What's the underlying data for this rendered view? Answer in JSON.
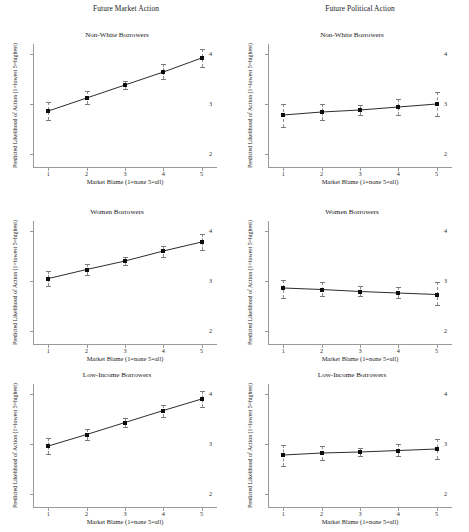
{
  "figure": {
    "columns": [
      {
        "title": "Future Market Action"
      },
      {
        "title": "Future Political Action"
      }
    ],
    "axis_titles": {
      "x": "Market Blame (1=none 5=all)",
      "y": "Predicted Likelihood of Action (1=lowest 5=highest)"
    },
    "xticks": [
      "1",
      "2",
      "3",
      "4",
      "5"
    ],
    "yticks": [
      "2",
      "3",
      "4"
    ]
  },
  "chart_data": [
    {
      "id": "market-nonwhite",
      "type": "line",
      "title": "Non-White Borrowers",
      "column": "Future Market Action",
      "xlabel": "Market Blame (1=none 5=all)",
      "ylabel": "Predicted Likelihood of Action (1=lowest 5=highest)",
      "x": [
        1,
        2,
        3,
        4,
        5
      ],
      "values": [
        2.86,
        3.12,
        3.38,
        3.64,
        3.92
      ],
      "ci_low": [
        2.68,
        3.0,
        3.3,
        3.5,
        3.75
      ],
      "ci_high": [
        3.04,
        3.26,
        3.47,
        3.8,
        4.1
      ],
      "xlim": [
        0.6,
        5.4
      ],
      "ylim": [
        1.72,
        4.2
      ],
      "grid": false,
      "legend": "none"
    },
    {
      "id": "political-nonwhite",
      "type": "line",
      "title": "Non-White Borrowers",
      "column": "Future Political Action",
      "xlabel": "Market Blame (1=none 5=all)",
      "ylabel": "Predicted Likelihood of Action (1=lowest 5=highest)",
      "x": [
        1,
        2,
        3,
        4,
        5
      ],
      "values": [
        2.78,
        2.84,
        2.88,
        2.94,
        3.0
      ],
      "ci_low": [
        2.55,
        2.68,
        2.79,
        2.78,
        2.76
      ],
      "ci_high": [
        3.0,
        3.0,
        2.99,
        3.1,
        3.25
      ],
      "xlim": [
        0.6,
        5.4
      ],
      "ylim": [
        1.72,
        4.2
      ],
      "grid": false,
      "legend": "none"
    },
    {
      "id": "market-women",
      "type": "line",
      "title": "Women Borrowers",
      "column": "Future Market Action",
      "xlabel": "Market Blame (1=none 5=all)",
      "ylabel": "Predicted Likelihood of Action (1=lowest 5=highest)",
      "x": [
        1,
        2,
        3,
        4,
        5
      ],
      "values": [
        3.05,
        3.23,
        3.4,
        3.6,
        3.78
      ],
      "ci_low": [
        2.9,
        3.12,
        3.32,
        3.48,
        3.62
      ],
      "ci_high": [
        3.2,
        3.34,
        3.48,
        3.71,
        3.94
      ],
      "xlim": [
        0.6,
        5.4
      ],
      "ylim": [
        1.72,
        4.2
      ],
      "grid": false,
      "legend": "none"
    },
    {
      "id": "political-women",
      "type": "line",
      "title": "Women Borrowers",
      "column": "Future Political Action",
      "xlabel": "Market Blame (1=none 5=all)",
      "ylabel": "Predicted Likelihood of Action (1=lowest 5=highest)",
      "x": [
        1,
        2,
        3,
        4,
        5
      ],
      "values": [
        2.86,
        2.83,
        2.79,
        2.76,
        2.73
      ],
      "ci_low": [
        2.66,
        2.71,
        2.71,
        2.66,
        2.52
      ],
      "ci_high": [
        3.03,
        2.98,
        2.9,
        2.89,
        2.98
      ],
      "xlim": [
        0.6,
        5.4
      ],
      "ylim": [
        1.72,
        4.2
      ],
      "grid": false,
      "legend": "none"
    },
    {
      "id": "market-lowincome",
      "type": "line",
      "title": "Low-Income Borrowers",
      "column": "Future Market Action",
      "xlabel": "Market Blame (1=none 5=all)",
      "ylabel": "Predicted Likelihood of Action (1=lowest 5=highest)",
      "x": [
        1,
        2,
        3,
        4,
        5
      ],
      "values": [
        2.96,
        3.19,
        3.43,
        3.67,
        3.9
      ],
      "ci_low": [
        2.8,
        3.08,
        3.35,
        3.55,
        3.74
      ],
      "ci_high": [
        3.12,
        3.3,
        3.52,
        3.79,
        4.06
      ],
      "xlim": [
        0.6,
        5.4
      ],
      "ylim": [
        1.72,
        4.2
      ],
      "grid": false,
      "legend": "none"
    },
    {
      "id": "political-lowincome",
      "type": "line",
      "title": "Low-Income Borrowers",
      "column": "Future Political Action",
      "xlabel": "Market Blame (1=none 5=all)",
      "ylabel": "Predicted Likelihood of Action (1=lowest 5=highest)",
      "x": [
        1,
        2,
        3,
        4,
        5
      ],
      "values": [
        2.78,
        2.82,
        2.84,
        2.87,
        2.9
      ],
      "ci_low": [
        2.57,
        2.68,
        2.76,
        2.76,
        2.7
      ],
      "ci_high": [
        2.98,
        2.96,
        2.93,
        3.0,
        3.11
      ],
      "xlim": [
        0.6,
        5.4
      ],
      "ylim": [
        1.72,
        4.2
      ],
      "grid": false,
      "legend": "none"
    }
  ]
}
